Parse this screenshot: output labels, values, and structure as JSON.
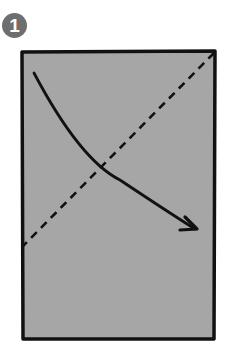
{
  "step": {
    "number": "1",
    "badge_color": "#6e6e6e"
  },
  "paper": {
    "fill": "#a6a6a6",
    "stroke": "#111111",
    "x": 22,
    "y": 52,
    "width": 192,
    "height": 287
  },
  "fold_line": {
    "type": "valley-fold-dashed",
    "from": [
      214,
      53
    ],
    "to": [
      23,
      246
    ]
  },
  "arrow": {
    "type": "fold-direction-arrow",
    "from": [
      34,
      73
    ],
    "to": [
      197,
      229
    ]
  }
}
